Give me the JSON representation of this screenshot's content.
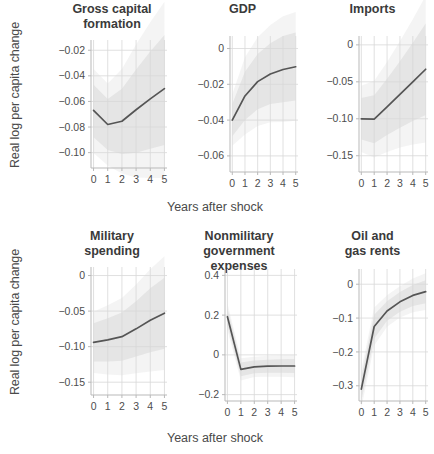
{
  "figure": {
    "shared_ylabel": "Real log per capita change",
    "shared_xlabel": "Years after shock",
    "line_color": "#555555",
    "band_color": "#bdbdbd",
    "grid_color": "#d8d8d8"
  },
  "chart_data": [
    {
      "type": "line",
      "title": "Gross capital\nformation",
      "xlabel": "Years after shock",
      "ylabel": "Real log per capita change",
      "x": [
        0,
        1,
        2,
        3,
        4,
        5
      ],
      "values": [
        -0.067,
        -0.078,
        -0.0755,
        -0.0665,
        -0.058,
        -0.05
      ],
      "ci_lower": [
        -0.088,
        -0.098,
        -0.101,
        -0.1,
        -0.097,
        -0.094
      ],
      "ci_upper": [
        -0.047,
        -0.058,
        -0.05,
        -0.035,
        -0.021,
        -0.008
      ],
      "xticks": [
        0,
        1,
        2,
        3,
        4,
        5
      ],
      "xticklabels": [
        "0",
        "1",
        "2",
        "3",
        "4",
        "5"
      ],
      "yticks": [
        -0.02,
        -0.04,
        -0.06,
        -0.08,
        -0.1
      ],
      "yticklabels": [
        "−0.02",
        "−0.04",
        "−0.06",
        "−0.08",
        "−0.10"
      ],
      "xlim": [
        -0.18,
        5.18
      ],
      "ylim": [
        -0.112,
        -0.012
      ],
      "grid": true
    },
    {
      "type": "line",
      "title": "GDP",
      "xlabel": "Years after shock",
      "ylabel": "Real log per capita change",
      "x": [
        0,
        1,
        2,
        3,
        4,
        5
      ],
      "values": [
        -0.04,
        -0.0265,
        -0.0185,
        -0.0142,
        -0.0117,
        -0.0102
      ],
      "ci_lower": [
        -0.049,
        -0.04,
        -0.034,
        -0.031,
        -0.03,
        -0.029
      ],
      "ci_upper": [
        -0.031,
        -0.013,
        -0.003,
        0.003,
        0.007,
        0.009
      ],
      "xticks": [
        0,
        1,
        2,
        3,
        4,
        5
      ],
      "xticklabels": [
        "0",
        "1",
        "2",
        "3",
        "4",
        "5"
      ],
      "yticks": [
        0,
        -0.02,
        -0.04,
        -0.06
      ],
      "yticklabels": [
        "0",
        "−0.02",
        "−0.04",
        "−0.06"
      ],
      "xlim": [
        -0.18,
        5.18
      ],
      "ylim": [
        -0.069,
        0.007
      ],
      "grid": true
    },
    {
      "type": "line",
      "title": "Imports",
      "xlabel": "Years after shock",
      "ylabel": "Real log per capita change",
      "x": [
        0,
        1,
        2,
        3,
        4,
        5
      ],
      "values": [
        -0.1,
        -0.1005,
        -0.084,
        -0.067,
        -0.05,
        -0.033
      ],
      "ci_lower": [
        -0.128,
        -0.133,
        -0.122,
        -0.112,
        -0.103,
        -0.095
      ],
      "ci_upper": [
        -0.072,
        -0.068,
        -0.046,
        -0.022,
        0.003,
        0.029
      ],
      "xticks": [
        0,
        1,
        2,
        3,
        4,
        5
      ],
      "xticklabels": [
        "0",
        "1",
        "2",
        "3",
        "4",
        "5"
      ],
      "yticks": [
        0,
        -0.05,
        -0.1,
        -0.15
      ],
      "yticklabels": [
        "0",
        "−0.05",
        "−0.10",
        "−0.15"
      ],
      "xlim": [
        -0.18,
        5.18
      ],
      "ylim": [
        -0.172,
        0.012
      ],
      "grid": true
    },
    {
      "type": "line",
      "title": "Military\nspending",
      "xlabel": "Years after shock",
      "ylabel": "Real log per capita change",
      "x": [
        0,
        1,
        2,
        3,
        4,
        5
      ],
      "values": [
        -0.094,
        -0.0905,
        -0.086,
        -0.075,
        -0.063,
        -0.053
      ],
      "ci_lower": [
        -0.121,
        -0.121,
        -0.12,
        -0.114,
        -0.108,
        -0.103
      ],
      "ci_upper": [
        -0.067,
        -0.06,
        -0.052,
        -0.036,
        -0.018,
        -0.003
      ],
      "xticks": [
        0,
        1,
        2,
        3,
        4,
        5
      ],
      "xticklabels": [
        "0",
        "1",
        "2",
        "3",
        "4",
        "5"
      ],
      "yticks": [
        0,
        -0.05,
        -0.1,
        -0.15
      ],
      "yticklabels": [
        "0",
        "−0.05",
        "−0.10",
        "−0.15"
      ],
      "xlim": [
        -0.18,
        5.18
      ],
      "ylim": [
        -0.168,
        0.012
      ],
      "grid": true
    },
    {
      "type": "line",
      "title": "Nonmilitary\ngovernment expenses",
      "xlabel": "Years after shock",
      "ylabel": "Real log per capita change",
      "x": [
        0,
        1,
        2,
        3,
        4,
        5
      ],
      "values": [
        0.192,
        -0.073,
        -0.06,
        -0.057,
        -0.056,
        -0.056
      ],
      "ci_lower": [
        0.15,
        -0.108,
        -0.092,
        -0.09,
        -0.09,
        -0.091
      ],
      "ci_upper": [
        0.234,
        -0.038,
        -0.028,
        -0.024,
        -0.022,
        -0.021
      ],
      "xticks": [
        0,
        1,
        2,
        3,
        4,
        5
      ],
      "xticklabels": [
        "0",
        "1",
        "2",
        "3",
        "4",
        "5"
      ],
      "yticks": [
        0.4,
        0.2,
        0,
        -0.2
      ],
      "yticklabels": [
        "0.4",
        "0.2",
        "0",
        "−0.2"
      ],
      "xlim": [
        -0.18,
        5.18
      ],
      "ylim": [
        -0.232,
        0.432
      ],
      "grid": true
    },
    {
      "type": "line",
      "title": "Oil and\ngas rents",
      "xlabel": "Years after shock",
      "ylabel": "Real log per capita change",
      "x": [
        0,
        1,
        2,
        3,
        4,
        5
      ],
      "values": [
        -0.31,
        -0.125,
        -0.079,
        -0.052,
        -0.033,
        -0.022
      ],
      "ci_lower": [
        -0.345,
        -0.16,
        -0.108,
        -0.081,
        -0.064,
        -0.056
      ],
      "ci_upper": [
        -0.275,
        -0.09,
        -0.05,
        -0.023,
        -0.002,
        0.012
      ],
      "xticks": [
        0,
        1,
        2,
        3,
        4,
        5
      ],
      "xticklabels": [
        "0",
        "1",
        "2",
        "3",
        "4",
        "5"
      ],
      "yticks": [
        0,
        -0.1,
        -0.2,
        -0.3
      ],
      "yticklabels": [
        "0",
        "−0.1",
        "−0.2",
        "−0.3"
      ],
      "xlim": [
        -0.18,
        5.18
      ],
      "ylim": [
        -0.345,
        0.045
      ],
      "grid": true
    }
  ]
}
